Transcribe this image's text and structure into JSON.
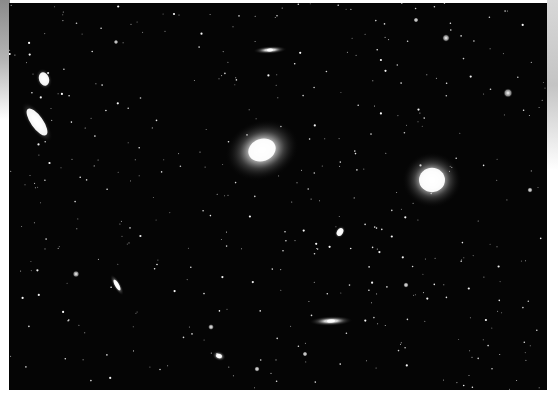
{
  "image": {
    "description": "Deep-sky photograph of a galaxy field (Virgo cluster region) with scattered stars",
    "frame": {
      "left": 9,
      "top": 3,
      "width": 538,
      "height": 387
    },
    "background_color": "#050505",
    "page_color": "#ffffff"
  },
  "galaxies": [
    {
      "name": "large-elliptical-center",
      "cx": 262,
      "cy": 150,
      "rx": 38,
      "ry": 30,
      "rot": -20,
      "core": 14
    },
    {
      "name": "round-elliptical-right",
      "cx": 432,
      "cy": 180,
      "rx": 30,
      "ry": 28,
      "rot": 0,
      "core": 13
    },
    {
      "name": "edge-on-top",
      "cx": 270,
      "cy": 50,
      "rx": 17,
      "ry": 4,
      "rot": -3,
      "core": 3
    },
    {
      "name": "small-elliptical-upper-left",
      "cx": 44,
      "cy": 79,
      "rx": 8,
      "ry": 11,
      "rot": -20,
      "core": 5
    },
    {
      "name": "spiral-upper-left",
      "cx": 37,
      "cy": 122,
      "rx": 9,
      "ry": 24,
      "rot": -35,
      "core": 6
    },
    {
      "name": "small-oval-mid",
      "cx": 340,
      "cy": 232,
      "rx": 5,
      "ry": 7,
      "rot": 30,
      "core": 3
    },
    {
      "name": "edge-on-lower-left",
      "cx": 117,
      "cy": 285,
      "rx": 4,
      "ry": 12,
      "rot": -30,
      "core": 2
    },
    {
      "name": "edge-on-bottom-center",
      "cx": 331,
      "cy": 321,
      "rx": 22,
      "ry": 5,
      "rot": -2,
      "core": 4
    },
    {
      "name": "small-oval-bottom",
      "cx": 219,
      "cy": 356,
      "rx": 7,
      "ry": 5,
      "rot": 20,
      "core": 3
    }
  ],
  "bright_stars": [
    {
      "x": 446,
      "y": 38,
      "r": 1.8
    },
    {
      "x": 508,
      "y": 93,
      "r": 2.2
    },
    {
      "x": 76,
      "y": 274,
      "r": 1.6
    },
    {
      "x": 211,
      "y": 327,
      "r": 1.4
    },
    {
      "x": 406,
      "y": 285,
      "r": 1.3
    },
    {
      "x": 257,
      "y": 369,
      "r": 1.3
    },
    {
      "x": 305,
      "y": 354,
      "r": 1.2
    },
    {
      "x": 116,
      "y": 42,
      "r": 1.1
    },
    {
      "x": 530,
      "y": 190,
      "r": 1.3
    },
    {
      "x": 416,
      "y": 20,
      "r": 1.2
    }
  ],
  "star_field": {
    "count": 420,
    "seed": 7
  }
}
